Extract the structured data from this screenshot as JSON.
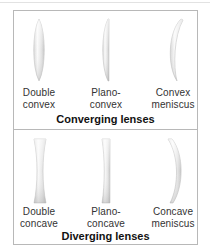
{
  "figure": {
    "sections": [
      {
        "heading": "Converging lenses",
        "lenses": [
          {
            "name": "double-convex",
            "label_line1": "Double",
            "label_line2": "convex"
          },
          {
            "name": "plano-convex",
            "label_line1": "Plano-",
            "label_line2": "convex"
          },
          {
            "name": "convex-meniscus",
            "label_line1": "Convex",
            "label_line2": "meniscus"
          }
        ]
      },
      {
        "heading": "Diverging lenses",
        "lenses": [
          {
            "name": "double-concave",
            "label_line1": "Double",
            "label_line2": "concave"
          },
          {
            "name": "plano-concave",
            "label_line1": "Plano-",
            "label_line2": "concave"
          },
          {
            "name": "concave-meniscus",
            "label_line1": "Concave",
            "label_line2": "meniscus"
          }
        ]
      }
    ],
    "colors": {
      "border": "#b8b8b8",
      "lens_light": "#f4f4f4",
      "lens_dark": "#c4c4c4",
      "text": "#333333"
    }
  }
}
